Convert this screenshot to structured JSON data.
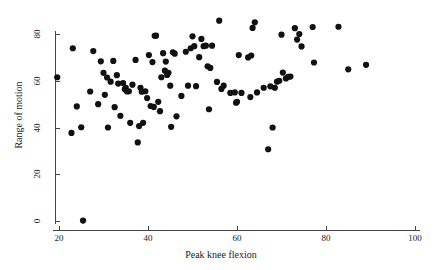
{
  "chart_data": {
    "type": "scatter",
    "title": "",
    "xlabel": "Peak knee flexion",
    "ylabel": "Range of motion",
    "xlim": [
      15,
      103
    ],
    "ylim": [
      -4,
      88
    ],
    "xticks": [
      20,
      40,
      60,
      80,
      100
    ],
    "yticks": [
      0,
      20,
      40,
      60,
      80
    ],
    "xtick_labels": [
      "20",
      "40",
      "60",
      "80",
      "100"
    ],
    "ytick_labels": [
      "0",
      "20",
      "40",
      "60",
      "80"
    ],
    "grid": false,
    "legend": null,
    "marker": {
      "shape": "circle",
      "color": "#111111",
      "size": 3.1
    },
    "series": [
      {
        "name": "observations",
        "points": [
          [
            19.6,
            61.5
          ],
          [
            22.8,
            37.7
          ],
          [
            23.1,
            73.9
          ],
          [
            24.0,
            49.0
          ],
          [
            25.0,
            40.1
          ],
          [
            25.4,
            0.2
          ],
          [
            27.0,
            55.4
          ],
          [
            27.7,
            72.7
          ],
          [
            28.8,
            50.0
          ],
          [
            29.4,
            68.3
          ],
          [
            30.0,
            63.4
          ],
          [
            30.3,
            54.0
          ],
          [
            30.8,
            61.4
          ],
          [
            31.0,
            40.0
          ],
          [
            31.6,
            59.6
          ],
          [
            32.2,
            68.5
          ],
          [
            32.5,
            48.7
          ],
          [
            33.0,
            62.4
          ],
          [
            33.3,
            58.8
          ],
          [
            33.8,
            45.0
          ],
          [
            34.4,
            59.0
          ],
          [
            34.8,
            56.4
          ],
          [
            35.0,
            57.0
          ],
          [
            35.3,
            55.4
          ],
          [
            35.7,
            55.5
          ],
          [
            36.0,
            42.0
          ],
          [
            36.5,
            58.3
          ],
          [
            37.2,
            68.9
          ],
          [
            37.7,
            33.6
          ],
          [
            38.0,
            40.6
          ],
          [
            38.3,
            57.0
          ],
          [
            38.6,
            55.3
          ],
          [
            38.9,
            42.0
          ],
          [
            39.4,
            55.5
          ],
          [
            39.8,
            52.6
          ],
          [
            40.2,
            71.0
          ],
          [
            40.6,
            49.2
          ],
          [
            41.0,
            68.0
          ],
          [
            41.3,
            48.8
          ],
          [
            41.5,
            79.2
          ],
          [
            41.8,
            79.3
          ],
          [
            42.3,
            51.0
          ],
          [
            42.7,
            47.0
          ],
          [
            43.0,
            61.5
          ],
          [
            43.4,
            71.8
          ],
          [
            43.8,
            64.3
          ],
          [
            44.0,
            68.2
          ],
          [
            44.3,
            62.5
          ],
          [
            44.6,
            63.4
          ],
          [
            45.0,
            57.9
          ],
          [
            45.2,
            40.3
          ],
          [
            45.6,
            72.2
          ],
          [
            46.0,
            71.6
          ],
          [
            46.4,
            44.8
          ],
          [
            47.5,
            53.5
          ],
          [
            48.5,
            72.4
          ],
          [
            49.0,
            57.9
          ],
          [
            49.6,
            73.9
          ],
          [
            50.0,
            79.0
          ],
          [
            50.4,
            74.8
          ],
          [
            50.8,
            57.7
          ],
          [
            51.5,
            70.1
          ],
          [
            52.0,
            77.9
          ],
          [
            52.5,
            74.8
          ],
          [
            53.0,
            75.0
          ],
          [
            53.4,
            66.2
          ],
          [
            53.7,
            47.8
          ],
          [
            54.0,
            65.5
          ],
          [
            54.4,
            75.0
          ],
          [
            55.5,
            59.5
          ],
          [
            56.0,
            85.7
          ],
          [
            56.5,
            56.5
          ],
          [
            57.0,
            57.9
          ],
          [
            58.5,
            54.8
          ],
          [
            59.5,
            55.0
          ],
          [
            59.8,
            50.6
          ],
          [
            60.0,
            51.0
          ],
          [
            60.4,
            71.0
          ],
          [
            61.0,
            54.8
          ],
          [
            62.5,
            70.0
          ],
          [
            63.0,
            53.0
          ],
          [
            63.2,
            70.8
          ],
          [
            63.5,
            82.6
          ],
          [
            64.0,
            85.0
          ],
          [
            64.5,
            55.0
          ],
          [
            66.0,
            57.0
          ],
          [
            67.0,
            30.7
          ],
          [
            67.5,
            57.6
          ],
          [
            68.0,
            40.0
          ],
          [
            68.5,
            57.0
          ],
          [
            69.0,
            59.6
          ],
          [
            69.5,
            60.0
          ],
          [
            70.0,
            79.7
          ],
          [
            70.3,
            63.5
          ],
          [
            71.0,
            61.0
          ],
          [
            71.5,
            61.7
          ],
          [
            72.0,
            61.8
          ],
          [
            73.0,
            82.5
          ],
          [
            73.5,
            77.6
          ],
          [
            74.0,
            80.0
          ],
          [
            74.5,
            74.7
          ],
          [
            77.0,
            83.0
          ],
          [
            77.3,
            67.8
          ],
          [
            82.8,
            83.1
          ],
          [
            85.0,
            64.9
          ],
          [
            89.0,
            66.8
          ]
        ]
      }
    ]
  },
  "axes": {
    "x_title": "Peak knee flexion",
    "y_title": "Range of motion"
  }
}
